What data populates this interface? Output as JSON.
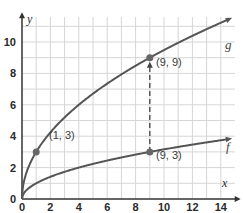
{
  "chart_data": {
    "type": "line",
    "title": "",
    "xlabel": "x",
    "ylabel": "y",
    "xlim": [
      0,
      15
    ],
    "ylim": [
      0,
      11.5
    ],
    "grid": true,
    "x_ticks": [
      "0",
      "2",
      "4",
      "6",
      "8",
      "10",
      "12",
      "14"
    ],
    "y_ticks": [
      "0",
      "2",
      "4",
      "6",
      "8",
      "10"
    ],
    "series": [
      {
        "name": "g",
        "equation": "g(x) = 3√x",
        "x": [
          0,
          1,
          4,
          9,
          14.8
        ],
        "y": [
          0,
          3,
          6,
          9,
          11.54
        ]
      },
      {
        "name": "f",
        "equation": "f(x) = √x",
        "x": [
          0,
          1,
          4,
          9,
          14.8
        ],
        "y": [
          0,
          1,
          2,
          3,
          3.85
        ]
      }
    ],
    "points": [
      {
        "label": "(1, 3)",
        "x": 1,
        "y": 3
      },
      {
        "label": "(9, 9)",
        "x": 9,
        "y": 9
      },
      {
        "label": "(9, 3)",
        "x": 9,
        "y": 3
      }
    ],
    "annotations": [
      {
        "type": "dashed-arrow",
        "from": [
          9,
          3
        ],
        "to": [
          9,
          9
        ]
      }
    ]
  },
  "labels": {
    "x_axis": "x",
    "y_axis": "y",
    "g": "g",
    "f": "f",
    "p1": "(1, 3)",
    "p2": "(9, 9)",
    "p3": "(9, 3)"
  },
  "ticks": {
    "x": [
      "0",
      "2",
      "4",
      "6",
      "8",
      "10",
      "12",
      "14"
    ],
    "y": [
      "0",
      "2",
      "4",
      "6",
      "8",
      "10"
    ]
  },
  "colors": {
    "curve": "#555555",
    "grid": "#d6d6d6",
    "axis": "#333333"
  }
}
